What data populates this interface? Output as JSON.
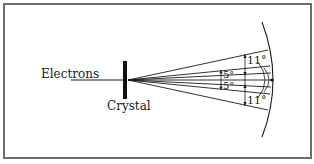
{
  "diagram": {
    "title": "",
    "labels": {
      "source": "Electrons",
      "target": "Crystal",
      "outer_angle_top": "11°",
      "outer_angle_bottom": "11°",
      "inner_angle_top": "5°",
      "inner_angle_bottom": "5°"
    },
    "colors": {
      "ink": "#1a1a1a",
      "frame": "#6e6e6e",
      "background": "#ffffff"
    },
    "elements": [
      "incident electron beam",
      "crystal slab",
      "diffracted rays fanning to screen",
      "curved detection screen",
      "angle dimension markers"
    ]
  }
}
